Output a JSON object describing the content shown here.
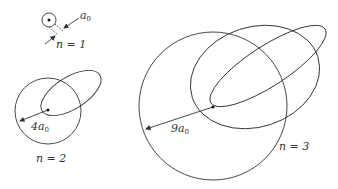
{
  "figure": {
    "panels": [
      {
        "n_label": "n = 1",
        "radius_label": "a",
        "radius_sub": "0"
      },
      {
        "n_label": "n = 2",
        "radius_label": "4a",
        "radius_sub": "0"
      },
      {
        "n_label": "n = 3",
        "radius_label": "9a",
        "radius_sub": "0"
      }
    ],
    "colors": {
      "stroke": "#333333",
      "background": "#ffffff"
    }
  }
}
